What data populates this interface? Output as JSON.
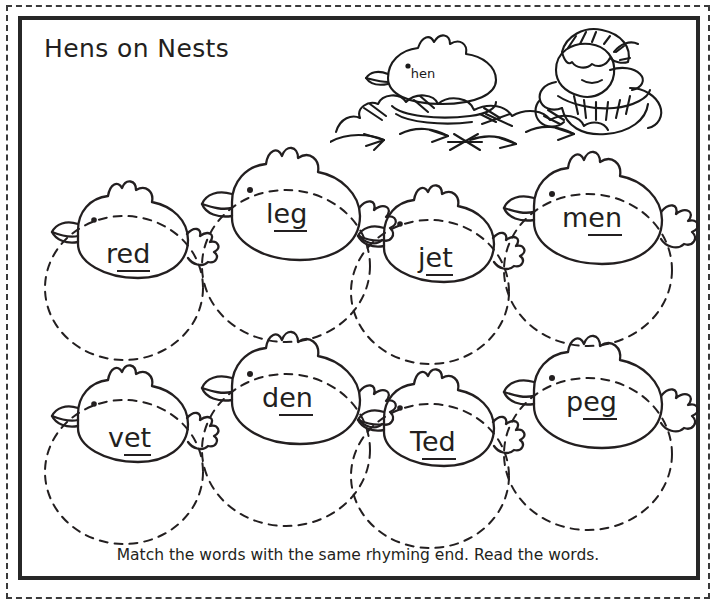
{
  "worksheet": {
    "title": "Hens on Nests",
    "instruction": "Match the words with the same rhyming end. Read the words."
  },
  "illustration": {
    "hen_on_nest_word": "hen",
    "scene_items": [
      "hen-on-nest-illustration",
      "straw-nest-illustration",
      "farmer-illustration"
    ]
  },
  "colors": {
    "ink": "#231f20",
    "frame": "#272727",
    "paper": "#ffffff"
  },
  "rows": [
    {
      "cells": [
        {
          "word": "red",
          "onset": "r",
          "rime": "ed",
          "size": "small"
        },
        {
          "word": "leg",
          "onset": "l",
          "rime": "eg",
          "size": "large"
        },
        {
          "word": "jet",
          "onset": "j",
          "rime": "et",
          "size": "small"
        },
        {
          "word": "men",
          "onset": "m",
          "rime": "en",
          "size": "large"
        }
      ]
    },
    {
      "cells": [
        {
          "word": "vet",
          "onset": "v",
          "rime": "et",
          "size": "small"
        },
        {
          "word": "den",
          "onset": "d",
          "rime": "en",
          "size": "large"
        },
        {
          "word": "Ted",
          "onset": "T",
          "rime": "ed",
          "size": "small"
        },
        {
          "word": "peg",
          "onset": "p",
          "rime": "eg",
          "size": "large"
        }
      ]
    }
  ]
}
